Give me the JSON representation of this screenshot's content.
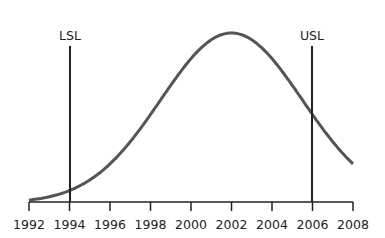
{
  "chart_data": {
    "type": "line",
    "title": "",
    "xlabel": "",
    "ylabel": "",
    "x_ticks": [
      "1992",
      "1994",
      "1996",
      "1998",
      "2000",
      "2002",
      "2004",
      "2006",
      "2008"
    ],
    "xlim": [
      1992,
      2008
    ],
    "grid": false,
    "series": [
      {
        "name": "normal distribution curve",
        "description": "bell curve centered near 2002",
        "mean": 2002,
        "std": 3.5,
        "x": [
          1992,
          1994,
          1996,
          1998,
          2000,
          2002,
          2004,
          2006,
          2008
        ],
        "relative_height": [
          0.01,
          0.05,
          0.22,
          0.55,
          0.9,
          1.0,
          0.82,
          0.4,
          0.14
        ]
      }
    ],
    "reference_lines": [
      {
        "label": "LSL",
        "x": 1994
      },
      {
        "label": "USL",
        "x": 2006
      }
    ]
  },
  "labels": {
    "lsl": "LSL",
    "usl": "USL",
    "ticks": [
      "1992",
      "1994",
      "1996",
      "1998",
      "2000",
      "2002",
      "2004",
      "2006",
      "2008"
    ]
  },
  "colors": {
    "curve": "#555555",
    "lines": "#222222",
    "axis": "#222222"
  }
}
